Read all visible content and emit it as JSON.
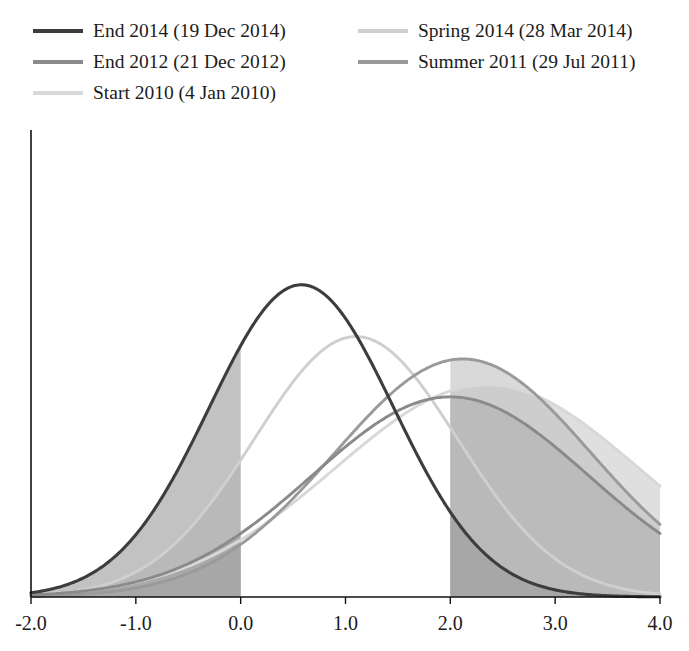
{
  "legend": {
    "items": [
      {
        "label": "End 2014 (19 Dec 2014)",
        "color": "#3d3d3d",
        "column": "left",
        "row": 0,
        "key": "end_2014"
      },
      {
        "label": "End 2012 (21 Dec 2012)",
        "color": "#8a8a8a",
        "column": "left",
        "row": 1,
        "key": "end_2012"
      },
      {
        "label": "Start 2010 (4 Jan 2010)",
        "color": "#d8d8d8",
        "column": "left",
        "row": 2,
        "key": "start_2010"
      },
      {
        "label": "Spring 2014 (28 Mar 2014)",
        "color": "#cfcfcf",
        "column": "right",
        "row": 0,
        "key": "spring_2014"
      },
      {
        "label": "Summer 2011 (29 Jul 2011)",
        "color": "#9a9a9a",
        "column": "right",
        "row": 1,
        "key": "summer_2011"
      }
    ]
  },
  "axis": {
    "x_ticks": [
      "-2.0",
      "-1.0",
      "0.0",
      "1.0",
      "2.0",
      "3.0",
      "4.0"
    ],
    "x_tick_values": [
      -2.0,
      -1.0,
      0.0,
      1.0,
      2.0,
      3.0,
      4.0
    ]
  },
  "chart_data": {
    "type": "line",
    "title": "",
    "xlabel": "",
    "ylabel": "",
    "xlim": [
      -2.0,
      4.0
    ],
    "ylim": [
      0,
      1.0
    ],
    "grid": false,
    "legend_position": "top",
    "shaded_bands": [
      {
        "name": "below-zero-tail",
        "from": -2.0,
        "to": 0.0
      },
      {
        "name": "above-two-tail",
        "from": 2.0,
        "to": 4.0
      }
    ],
    "series": [
      {
        "name": "End 2014 (19 Dec 2014)",
        "key": "end_2014",
        "color": "#3d3d3d",
        "fill": "#9d9d9d",
        "mean": 0.58,
        "sigma": 0.88,
        "peak_value": 0.905,
        "x": [
          -2.0,
          -1.5,
          -1.0,
          -0.5,
          0.0,
          0.5,
          0.58,
          1.0,
          1.5,
          2.0,
          2.5,
          3.0,
          3.5,
          4.0
        ],
        "y": [
          0.02,
          0.062,
          0.157,
          0.318,
          0.557,
          0.894,
          0.905,
          0.81,
          0.541,
          0.282,
          0.114,
          0.036,
          0.009,
          0.002
        ]
      },
      {
        "name": "Spring 2014 (28 Mar 2014)",
        "key": "spring_2014",
        "color": "#cfcfcf",
        "fill": "#d7d7d7",
        "mean": 1.1,
        "sigma": 0.97,
        "peak_value": 0.755,
        "x": [
          -2.0,
          -1.5,
          -1.0,
          -0.5,
          0.0,
          0.5,
          1.0,
          1.1,
          1.5,
          2.0,
          2.5,
          3.0,
          3.5,
          4.0
        ],
        "y": [
          0.006,
          0.019,
          0.05,
          0.113,
          0.221,
          0.38,
          0.645,
          0.755,
          0.64,
          0.4,
          0.216,
          0.1,
          0.04,
          0.014
        ]
      },
      {
        "name": "Summer 2011 (29 Jul 2011)",
        "key": "summer_2011",
        "color": "#9a9a9a",
        "fill": "#c1c1c1",
        "mean": 2.12,
        "sigma": 1.22,
        "peak_value": 0.69,
        "x": [
          -2.0,
          -1.5,
          -1.0,
          -0.5,
          0.0,
          0.5,
          1.0,
          1.5,
          2.0,
          2.12,
          2.5,
          3.0,
          3.5,
          4.0
        ],
        "y": [
          0.012,
          0.026,
          0.052,
          0.095,
          0.16,
          0.25,
          0.36,
          0.5,
          0.65,
          0.69,
          0.64,
          0.52,
          0.385,
          0.27
        ]
      },
      {
        "name": "End 2012 (21 Dec 2012)",
        "key": "end_2012",
        "color": "#8a8a8a",
        "fill": "#b0b0b0",
        "mean": 2.0,
        "sigma": 1.32,
        "peak_value": 0.58,
        "x": [
          -2.0,
          -1.5,
          -1.0,
          -0.5,
          0.0,
          0.5,
          1.0,
          1.5,
          2.0,
          2.5,
          3.0,
          3.5,
          4.0
        ],
        "y": [
          0.022,
          0.04,
          0.07,
          0.118,
          0.19,
          0.29,
          0.4,
          0.505,
          0.578,
          0.548,
          0.452,
          0.34,
          0.238
        ]
      },
      {
        "name": "Start 2010 (4 Jan 2010)",
        "key": "start_2010",
        "color": "#d8d8d8",
        "fill": "#cccccc",
        "mean": 2.35,
        "sigma": 1.45,
        "peak_value": 0.615,
        "x": [
          -2.0,
          -1.5,
          -1.0,
          -0.5,
          0.0,
          0.5,
          1.0,
          1.5,
          2.0,
          2.35,
          2.5,
          3.0,
          3.5,
          4.0
        ],
        "y": [
          0.01,
          0.02,
          0.04,
          0.075,
          0.128,
          0.205,
          0.305,
          0.42,
          0.535,
          0.6,
          0.61,
          0.57,
          0.47,
          0.35
        ]
      }
    ]
  }
}
